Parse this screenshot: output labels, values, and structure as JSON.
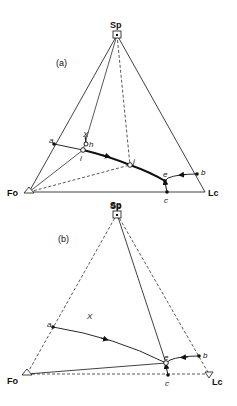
{
  "diagram_a": {
    "panel_label": "(a)",
    "vertex_top": "Sp",
    "vertex_left": "Fo",
    "vertex_right": "Lc",
    "base_label": "Sp",
    "points": {
      "a": "a",
      "b": "b",
      "c": "c",
      "e": "e",
      "h": "h",
      "i": "i",
      "j": "j",
      "X": "X"
    }
  },
  "diagram_b": {
    "panel_label": "(b)",
    "vertex_top": "Sp",
    "vertex_left": "Fo",
    "vertex_right": "Lc",
    "points": {
      "a": "a",
      "b": "b",
      "c": "c",
      "e": "e",
      "X": "X"
    }
  }
}
